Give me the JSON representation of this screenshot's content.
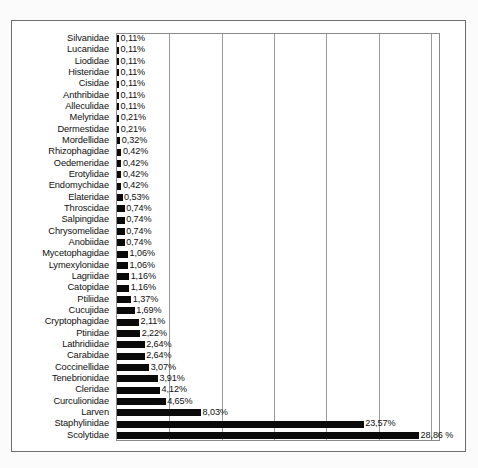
{
  "chart_data": {
    "type": "bar",
    "orientation": "horizontal",
    "title": "",
    "subtitle": "",
    "xlabel": "",
    "ylabel": "",
    "xlim": [
      0,
      30
    ],
    "grid": true,
    "gridline_values": [
      0,
      5,
      10,
      15,
      20,
      25,
      30
    ],
    "legend": null,
    "value_suffix": "%",
    "decimal_separator": ",",
    "categories": [
      "Silvanidae",
      "Lucanidae",
      "Liodidae",
      "Histeridae",
      "Cisidae",
      "Anthribidae",
      "Alleculidae",
      "Melyridae",
      "Dermestidae",
      "Mordellidae",
      "Rhizophagidae",
      "Oedemeridae",
      "Erotylidae",
      "Endomychidae",
      "Elateridae",
      "Throscidae",
      "Salpingidae",
      "Chrysomelidae",
      "Anobiidae",
      "Mycetophagidae",
      "Lymexylonidae",
      "Lagriidae",
      "Catopidae",
      "Ptiliidae",
      "Cucujidae",
      "Cryptophagidae",
      "Ptinidae",
      "Lathridiidae",
      "Carabidae",
      "Coccinellidae",
      "Tenebrionidae",
      "Cleridae",
      "Curculionidae",
      "Larven",
      "Staphylinidae",
      "Scolytidae"
    ],
    "values": [
      0.11,
      0.11,
      0.11,
      0.11,
      0.11,
      0.11,
      0.11,
      0.21,
      0.21,
      0.32,
      0.42,
      0.42,
      0.42,
      0.42,
      0.53,
      0.74,
      0.74,
      0.74,
      0.74,
      1.06,
      1.06,
      1.16,
      1.16,
      1.37,
      1.69,
      2.11,
      2.22,
      2.64,
      2.64,
      3.07,
      3.91,
      4.12,
      4.65,
      8.03,
      23.57,
      28.86
    ],
    "value_labels": [
      "0,11%",
      "0,11%",
      "0,11%",
      "0,11%",
      "0,11%",
      "0,11%",
      "0,11%",
      "0,21%",
      "0,21%",
      "0,32%",
      "0,42%",
      "0,42%",
      "0,42%",
      "0,42%",
      "0,53%",
      "0,74%",
      "0,74%",
      "0,74%",
      "0,74%",
      "1,06%",
      "1,06%",
      "1,16%",
      "1,16%",
      "1,37%",
      "1,69%",
      "2,11%",
      "2,22%",
      "2,64%",
      "2,64%",
      "3,07%",
      "3,91%",
      "4,12%",
      "4,65%",
      "8,03%",
      "23,57%",
      "28,86 %"
    ],
    "bar_color": "#0a0a0a",
    "grid_color": "#9a9a9a",
    "background_color": "#ffffff"
  }
}
